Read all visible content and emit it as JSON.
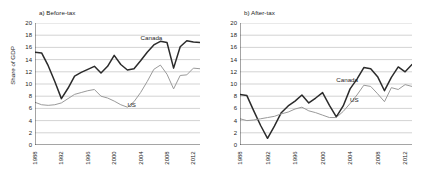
{
  "chart_data": [
    {
      "type": "line",
      "title": "a) Before-tax",
      "panel_id": "a",
      "xlabel": "",
      "ylabel": "Share of GDP",
      "ylim": [
        0,
        20
      ],
      "ytick_step": 2,
      "yticks": [
        0,
        2,
        4,
        6,
        8,
        10,
        12,
        14,
        16,
        18,
        20
      ],
      "xlim": [
        1988,
        2013
      ],
      "xticks": [
        1988,
        1992,
        1996,
        2000,
        2004,
        2008,
        2012
      ],
      "grid": "horizontal",
      "legend": "inline-annotations",
      "x": [
        1988,
        1989,
        1990,
        1991,
        1992,
        1993,
        1994,
        1995,
        1996,
        1997,
        1998,
        1999,
        2000,
        2001,
        2002,
        2003,
        2004,
        2005,
        2006,
        2007,
        2008,
        2009,
        2010,
        2011,
        2012,
        2013
      ],
      "series": [
        {
          "name": "Canada",
          "color": "#2b2b2b",
          "values": [
            15.2,
            15.1,
            13.0,
            10.4,
            7.6,
            9.3,
            11.3,
            11.9,
            12.4,
            12.9,
            11.8,
            12.9,
            14.7,
            13.2,
            12.3,
            12.5,
            13.8,
            15.2,
            16.4,
            17.0,
            16.8,
            12.6,
            16.1,
            17.1,
            16.9,
            16.8
          ],
          "label_pos": {
            "x": 2004,
            "y": 17.6
          }
        },
        {
          "name": "US",
          "color": "#9a9a9a",
          "values": [
            7.0,
            6.6,
            6.5,
            6.6,
            6.9,
            7.6,
            8.3,
            8.6,
            8.9,
            9.1,
            8.0,
            7.7,
            7.2,
            6.6,
            6.2,
            7.1,
            8.6,
            10.4,
            12.4,
            13.1,
            11.6,
            9.2,
            11.4,
            11.5,
            12.6,
            12.5
          ],
          "label_pos": {
            "x": 2002,
            "y": 6.6
          }
        }
      ]
    },
    {
      "type": "line",
      "title": "b) After-tax",
      "panel_id": "b",
      "xlabel": "",
      "ylabel": "",
      "ylim": [
        0,
        20
      ],
      "ytick_step": 2,
      "yticks": [
        0,
        2,
        4,
        6,
        8,
        10,
        12,
        14,
        16,
        18,
        20
      ],
      "xlim": [
        1988,
        2013
      ],
      "xticks": [
        1988,
        1992,
        1996,
        2000,
        2004,
        2008,
        2012
      ],
      "grid": "horizontal",
      "legend": "inline-annotations",
      "x": [
        1988,
        1989,
        1990,
        1991,
        1992,
        1993,
        1994,
        1995,
        1996,
        1997,
        1998,
        1999,
        2000,
        2001,
        2002,
        2003,
        2004,
        2005,
        2006,
        2007,
        2008,
        2009,
        2010,
        2011,
        2012,
        2013
      ],
      "series": [
        {
          "name": "Canada",
          "color": "#2b2b2b",
          "values": [
            8.3,
            8.1,
            5.6,
            3.2,
            1.1,
            3.1,
            5.3,
            6.4,
            7.2,
            8.2,
            6.9,
            7.7,
            8.6,
            6.5,
            4.6,
            6.4,
            9.2,
            10.8,
            12.7,
            12.5,
            11.2,
            8.9,
            11.1,
            12.8,
            12.0,
            13.2
          ],
          "label_pos": {
            "x": 2002,
            "y": 10.6
          }
        },
        {
          "name": "US",
          "color": "#9a9a9a",
          "values": [
            4.3,
            4.0,
            4.1,
            4.3,
            4.5,
            4.7,
            5.1,
            5.4,
            5.9,
            6.2,
            5.6,
            5.3,
            4.9,
            4.5,
            4.5,
            5.5,
            6.8,
            8.2,
            9.8,
            9.6,
            8.4,
            7.1,
            9.4,
            9.1,
            9.9,
            9.6
          ],
          "label_pos": {
            "x": 2004,
            "y": 7.4
          }
        }
      ]
    }
  ],
  "panels": {
    "a": {
      "title": "a) Before-tax",
      "ylabel": "Share of GDP",
      "yticks": [
        "20",
        "18",
        "16",
        "14",
        "12",
        "10",
        "8",
        "6",
        "4",
        "2",
        "0"
      ],
      "xticks": [
        "1988",
        "1992",
        "1996",
        "2000",
        "2004",
        "2008",
        "2012"
      ],
      "canada_label": "Canada",
      "us_label": "US"
    },
    "b": {
      "title": "b) After-tax",
      "ylabel": "",
      "yticks": [
        "20",
        "18",
        "16",
        "14",
        "12",
        "10",
        "8",
        "6",
        "4",
        "2",
        "0"
      ],
      "xticks": [
        "1988",
        "1992",
        "1996",
        "2000",
        "2004",
        "2008",
        "2012"
      ],
      "canada_label": "Canada",
      "us_label": "US"
    }
  },
  "colors": {
    "canada_line": "#2b2b2b",
    "us_line": "#9a9a9a",
    "grid": "#b5b5b5",
    "axis": "#1d1d1d"
  }
}
